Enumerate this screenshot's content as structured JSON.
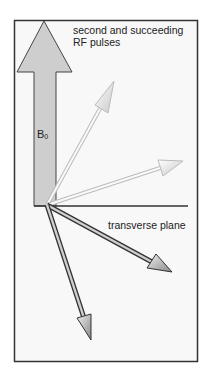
{
  "diagram": {
    "title_line1": "second and succeeding",
    "title_line2": "RF pulses",
    "b0_label": "B",
    "b0_subscript": "0",
    "plane_label": "transverse plane",
    "colors": {
      "frame": "#333333",
      "background": "#f7f7f7",
      "b0_arrow_fill": "#cfcfcf",
      "light_arrows": "#d8d8d8",
      "dark_arrows": "#3a3a3a"
    },
    "vectors": [
      {
        "name": "magnetization-light-1",
        "tone": "light"
      },
      {
        "name": "magnetization-light-2",
        "tone": "light"
      },
      {
        "name": "magnetization-dark-1",
        "tone": "dark"
      },
      {
        "name": "magnetization-dark-2",
        "tone": "dark"
      }
    ]
  }
}
